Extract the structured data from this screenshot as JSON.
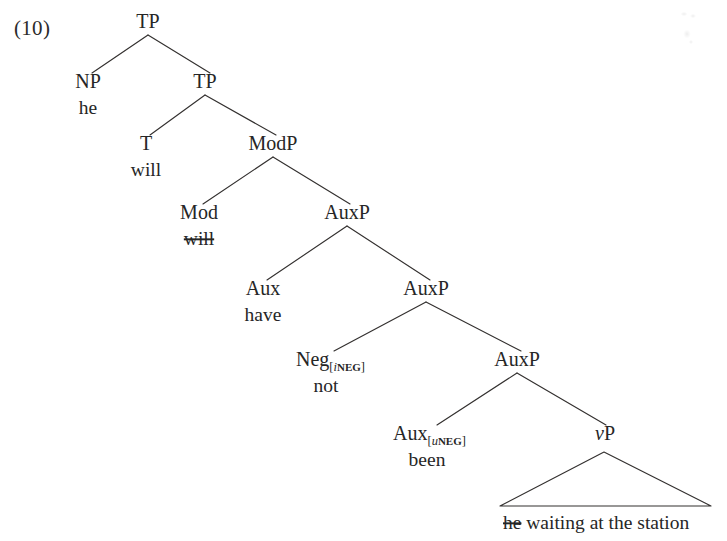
{
  "document": {
    "example_number": "(10)",
    "domain": "linguistics-syntax-tree"
  },
  "colors": {
    "ink": "#262626",
    "line": "#33302f",
    "page_background": "#ffffff"
  },
  "tree": {
    "description": "X-bar syntactic tree for 'he will have not been waiting at the station'",
    "sentence": "he will have not been waiting at the station",
    "nodes": {
      "tp_root": {
        "label": "TP",
        "x": 148,
        "y": 28
      },
      "np": {
        "label": "NP",
        "x": 88,
        "y": 88
      },
      "np_word": {
        "label": "he",
        "x": 88,
        "y": 114,
        "struck": false
      },
      "tp2": {
        "label": "TP",
        "x": 205,
        "y": 88
      },
      "t": {
        "label": "T",
        "x": 146,
        "y": 150
      },
      "t_word": {
        "label": "will",
        "x": 146,
        "y": 176,
        "struck": false
      },
      "modp": {
        "label": "ModP",
        "x": 273,
        "y": 150
      },
      "mod": {
        "label": "Mod",
        "x": 199,
        "y": 219
      },
      "mod_word": {
        "label": "will",
        "x": 199,
        "y": 245,
        "struck": true
      },
      "auxp1": {
        "label": "AuxP",
        "x": 347,
        "y": 219
      },
      "aux1": {
        "label": "Aux",
        "x": 263,
        "y": 295
      },
      "aux1_word": {
        "label": "have",
        "x": 263,
        "y": 321,
        "struck": false
      },
      "auxp2": {
        "label": "AuxP",
        "x": 426,
        "y": 295
      },
      "neg": {
        "label": "Neg",
        "subscript": "[iNEG]",
        "feature_prefix": "i",
        "feature_name": "NEG",
        "x": 326,
        "y": 366
      },
      "neg_word": {
        "label": "not",
        "x": 326,
        "y": 392,
        "struck": false
      },
      "auxp3": {
        "label": "AuxP",
        "x": 517,
        "y": 366
      },
      "aux2": {
        "label": "Aux",
        "subscript": "[uNEG]",
        "feature_prefix": "u",
        "feature_name": "NEG",
        "x": 427,
        "y": 440
      },
      "aux2_word": {
        "label": "been",
        "x": 427,
        "y": 466,
        "struck": false
      },
      "vp": {
        "label_italic": "v",
        "label_roman": "P",
        "x": 605,
        "y": 440
      }
    },
    "triangle": {
      "apex_x": 604,
      "apex_y": 452,
      "left_x": 500,
      "right_x": 711,
      "base_y": 506
    },
    "triangle_text": {
      "struck_part": "he",
      "rest_part": " waiting at the station",
      "x": 503,
      "y": 529
    }
  }
}
